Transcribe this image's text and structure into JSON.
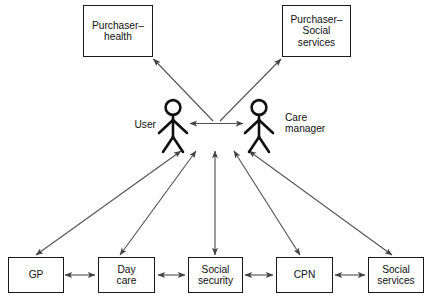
{
  "diagram": {
    "background_color": "#ffffff",
    "stroke_color": "#1a1a1a",
    "arrow_color": "#555555",
    "top_nodes": [
      {
        "id": "purchaser-health",
        "label": "Purchaser–\nhealth"
      },
      {
        "id": "purchaser-social-services",
        "label": "Purchaser–\nSocial\nservices"
      }
    ],
    "actors": [
      {
        "id": "user",
        "label": "User",
        "icon": "stick-figure-icon"
      },
      {
        "id": "care-manager",
        "label": "Care\nmanager",
        "icon": "stick-figure-icon"
      }
    ],
    "bottom_nodes": [
      {
        "id": "gp",
        "label": "GP"
      },
      {
        "id": "day-care",
        "label": "Day\ncare"
      },
      {
        "id": "social-security",
        "label": "Social\nsecurity"
      },
      {
        "id": "cpn",
        "label": "CPN"
      },
      {
        "id": "social-services",
        "label": "Social\nservices"
      }
    ],
    "connections": [
      {
        "from": "center",
        "to": "purchaser-health",
        "type": "single-arrow"
      },
      {
        "from": "center",
        "to": "purchaser-social-services",
        "type": "single-arrow"
      },
      {
        "from": "user",
        "to": "care-manager",
        "type": "double-arrow"
      },
      {
        "from": "gp",
        "to": "actors",
        "type": "double-arrow"
      },
      {
        "from": "day-care",
        "to": "actors",
        "type": "double-arrow"
      },
      {
        "from": "social-security",
        "to": "actors",
        "type": "double-arrow"
      },
      {
        "from": "cpn",
        "to": "actors",
        "type": "double-arrow"
      },
      {
        "from": "social-services",
        "to": "actors",
        "type": "double-arrow"
      },
      {
        "from": "gp",
        "to": "day-care",
        "type": "double-arrow"
      },
      {
        "from": "day-care",
        "to": "social-security",
        "type": "double-arrow"
      },
      {
        "from": "social-security",
        "to": "cpn",
        "type": "double-arrow"
      },
      {
        "from": "cpn",
        "to": "social-services",
        "type": "double-arrow"
      }
    ]
  }
}
